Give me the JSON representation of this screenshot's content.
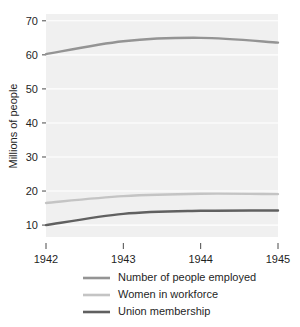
{
  "chart_data": {
    "type": "line",
    "title": "",
    "subtitle": "",
    "xlabel": "",
    "ylabel": "Millions of people",
    "x": [
      1942,
      1943,
      1944,
      1945
    ],
    "categories": [
      "1942",
      "1943",
      "1944",
      "1945"
    ],
    "xlim": [
      1942,
      1945
    ],
    "ylim": [
      6.5,
      72
    ],
    "yticks": [
      10,
      20,
      30,
      40,
      50,
      60,
      70
    ],
    "ytick_labels": [
      "10",
      "20",
      "30",
      "40",
      "50",
      "60",
      "70"
    ],
    "xtick_labels": [
      "1942",
      "1943",
      "1944",
      "1945"
    ],
    "grid": "horizontal",
    "plot_background": "#f0f0f0",
    "figure_background": "#ffffff",
    "legend_position": "below",
    "series": [
      {
        "name": "Number of people employed",
        "values": [
          60.2,
          64.0,
          65.0,
          63.6
        ],
        "color": "#949494"
      },
      {
        "name": "Women in workforce",
        "values": [
          16.5,
          18.5,
          19.2,
          19.1
        ],
        "color": "#c4c4c4"
      },
      {
        "name": "Union membership",
        "values": [
          10.0,
          13.3,
          14.2,
          14.3
        ],
        "color": "#606060"
      }
    ]
  },
  "axis": {
    "y_title": "Millions of people",
    "y_ticks": [
      "70",
      "60",
      "50",
      "40",
      "30",
      "20",
      "10"
    ],
    "x_ticks": [
      "1942",
      "1943",
      "1944",
      "1945"
    ]
  },
  "legend": {
    "entries": [
      {
        "label": "Number of people employed",
        "color": "#949494"
      },
      {
        "label": "Women in workforce",
        "color": "#c4c4c4"
      },
      {
        "label": "Union membership",
        "color": "#606060"
      }
    ]
  }
}
